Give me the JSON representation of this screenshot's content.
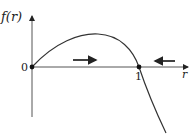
{
  "diagram": {
    "y_axis_label": "f(r)",
    "x_axis_label": "r",
    "tick_labels": {
      "origin": "0",
      "root": "1"
    },
    "fixed_points": [
      {
        "name": "r=0",
        "value": 0,
        "stability": "unstable"
      },
      {
        "name": "r=1",
        "value": 1,
        "stability": "stable"
      }
    ],
    "flow_arrows": [
      {
        "region": "0<r<1",
        "direction": "right"
      },
      {
        "region": "r>1",
        "direction": "left"
      }
    ],
    "colors": {
      "stroke": "#222222",
      "axis": "#555555"
    }
  }
}
